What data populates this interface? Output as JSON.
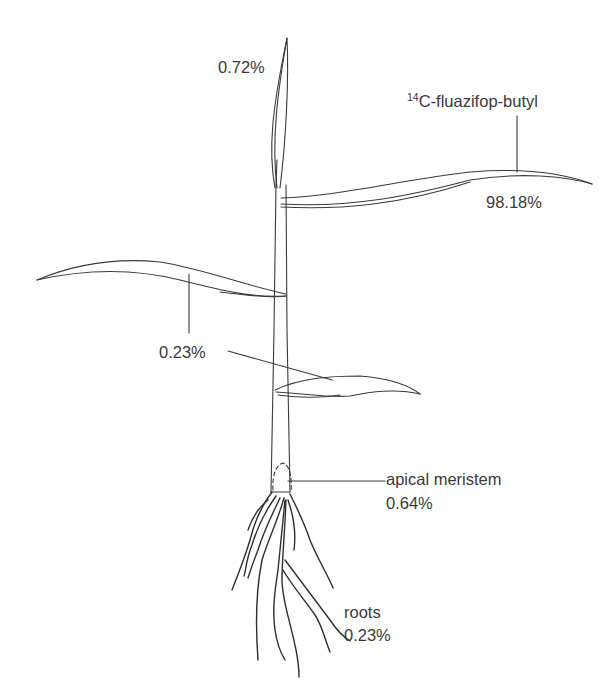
{
  "diagram": {
    "labels": {
      "top_leaf": "0.72%",
      "treated_leaf_superscript": "14",
      "treated_leaf_name": "C-fluazifop-butyl",
      "treated_leaf_value": "98.18%",
      "lower_leaves_value": "0.23%",
      "meristem_name": "apical meristem",
      "meristem_value": "0.64%",
      "roots_name": "roots",
      "roots_value": "0.23%"
    },
    "colors": {
      "line": "#3a3a3a",
      "text": "#3a3a3a",
      "background": "#ffffff"
    }
  }
}
